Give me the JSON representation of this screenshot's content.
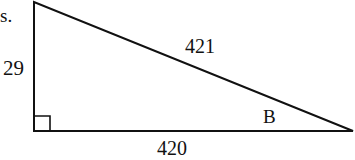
{
  "diagram": {
    "type": "right-triangle",
    "fragment_text": "s.",
    "sides": {
      "vertical_leg": "29",
      "horizontal_leg": "420",
      "hypotenuse": "421"
    },
    "angle_label": "B",
    "right_angle_marker": true,
    "colors": {
      "stroke": "#111111",
      "background": "#ffffff"
    }
  }
}
